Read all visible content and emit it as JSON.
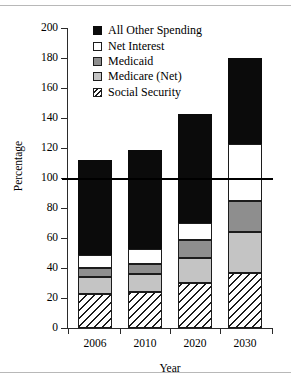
{
  "chart_data": {
    "type": "bar",
    "subtype": "stacked-vertical",
    "title": "",
    "xlabel": "Year",
    "ylabel": "Percentage",
    "categories": [
      "2006",
      "2010",
      "2020",
      "2030"
    ],
    "ylim": [
      0,
      200
    ],
    "yticks": [
      0,
      20,
      40,
      60,
      80,
      100,
      120,
      140,
      160,
      180,
      200
    ],
    "xticks": [
      "2006",
      "2010",
      "2020",
      "2030"
    ],
    "grid": false,
    "legend_position": "top-center",
    "reference_lines": [
      {
        "axis": "y",
        "value": 100,
        "style": "solid",
        "color": "#000000"
      }
    ],
    "stack_order_bottom_to_top": [
      "Social Security",
      "Medicare (Net)",
      "Medicaid",
      "Net Interest",
      "All Other Spending"
    ],
    "series": [
      {
        "name": "Social Security",
        "pattern": "diagonal-hatch",
        "color": "#ffffff",
        "values": [
          23,
          24,
          30,
          37
        ]
      },
      {
        "name": "Medicare (Net)",
        "pattern": "solid",
        "color": "#c4c4c4",
        "values": [
          11,
          12,
          17,
          27
        ]
      },
      {
        "name": "Medicaid",
        "pattern": "solid",
        "color": "#8e8e8e",
        "values": [
          6,
          7,
          12,
          21
        ]
      },
      {
        "name": "Net Interest",
        "pattern": "solid",
        "color": "#ffffff",
        "values": [
          9,
          10,
          11,
          38
        ]
      },
      {
        "name": "All Other Spending",
        "pattern": "solid",
        "color": "#0b0b0b",
        "values": [
          63,
          66,
          73,
          57
        ]
      }
    ],
    "totals": [
      112,
      119,
      143,
      180
    ],
    "cumulative_tops": [
      [
        23,
        34,
        40,
        49,
        112
      ],
      [
        24,
        36,
        43,
        53,
        119
      ],
      [
        30,
        47,
        59,
        70,
        143
      ],
      [
        37,
        64,
        85,
        123,
        180
      ]
    ]
  },
  "legend": {
    "items": [
      {
        "label": "All Other Spending",
        "key": "all-other"
      },
      {
        "label": "Net Interest",
        "key": "net-int"
      },
      {
        "label": "Medicaid",
        "key": "medicaid"
      },
      {
        "label": "Medicare (Net)",
        "key": "medicare"
      },
      {
        "label": "Social Security",
        "key": "social-sec"
      }
    ]
  },
  "axes": {
    "y_title": "Percentage",
    "x_title": "Year",
    "y_tick_labels": [
      "200",
      "180",
      "160",
      "140",
      "120",
      "100",
      "80",
      "60",
      "40",
      "20",
      "0"
    ],
    "x_tick_labels": [
      "2006",
      "2010",
      "2020",
      "2030"
    ]
  }
}
